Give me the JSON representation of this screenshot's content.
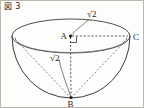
{
  "figure": {
    "caption": "図 3",
    "shape": "hemisphere-bowl",
    "colors": {
      "outline": "#3a3a3a",
      "hidden": "#6e6e6e",
      "dashed": "#2e2e2e",
      "text": "#1d1d1d",
      "background": "#fdfdfc",
      "border": "#b9b9b4"
    }
  },
  "points": [
    {
      "id": "A",
      "label": "A",
      "role": "rim-center",
      "x": 69,
      "y": 35
    },
    {
      "id": "C",
      "label": "C",
      "role": "rim-right",
      "x": 129,
      "y": 35
    },
    {
      "id": "B",
      "label": "B",
      "role": "bowl-bottom",
      "x": 70,
      "y": 97
    }
  ],
  "measurements": [
    {
      "id": "AC",
      "label": "√2",
      "segment": "A-C",
      "position": "above-right"
    },
    {
      "id": "AB",
      "label": "√2",
      "segment": "A-B",
      "position": "left-of-axis"
    }
  ],
  "marks": [
    {
      "id": "right-angle-A",
      "type": "right-angle",
      "at": "A",
      "between": "AC-AB"
    }
  ],
  "geometry": {
    "rim_ellipse": {
      "cx": 70,
      "cy": 35,
      "rx": 59,
      "ry": 17
    },
    "bowl_lower_arc": {
      "cx": 70,
      "cy": 35,
      "rx": 59,
      "ry": 62
    },
    "dashed_segments": [
      {
        "from": "A",
        "to": "C"
      },
      {
        "from": "A",
        "to": "B"
      },
      {
        "from": "B",
        "to": "rim-left"
      },
      {
        "from": "B",
        "to": "rim-right"
      }
    ]
  }
}
